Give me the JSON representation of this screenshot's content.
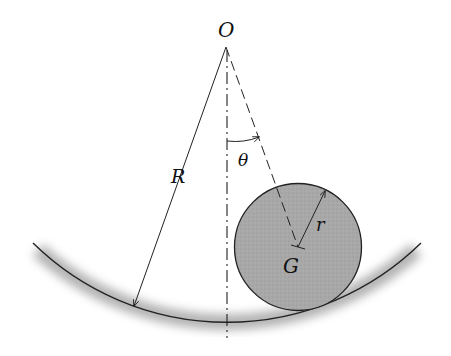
{
  "diagram": {
    "labels": {
      "origin": "O",
      "big_radius": "R",
      "angle": "θ",
      "small_radius": "r",
      "center_of_mass": "G"
    },
    "geometry": {
      "origin": [
        226,
        46
      ],
      "R_px": 277,
      "G": [
        298,
        247
      ],
      "r_px": 63.5
    },
    "colors": {
      "line": "#222222",
      "disk_fill": "#a9a9a9",
      "shadow": "#9a9a9a"
    }
  }
}
